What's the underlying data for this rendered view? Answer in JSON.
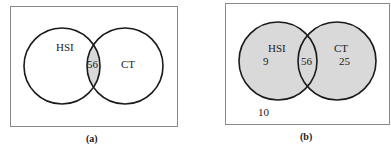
{
  "panels": [
    {
      "caption": "(a)",
      "sets": [
        {
          "label": "HSI"
        },
        {
          "label": "CT"
        }
      ],
      "intersection_value": "56",
      "shading": "intersection-only"
    },
    {
      "caption": "(b)",
      "sets": [
        {
          "label": "HSI",
          "only_value": "9"
        },
        {
          "label": "CT",
          "only_value": "25"
        }
      ],
      "intersection_value": "56",
      "outside_value": "10",
      "shading": "union"
    }
  ],
  "colors": {
    "border": "#888888",
    "circle_stroke": "#1a1a1a",
    "shade": "#d9d9d9",
    "text": "#222222"
  }
}
